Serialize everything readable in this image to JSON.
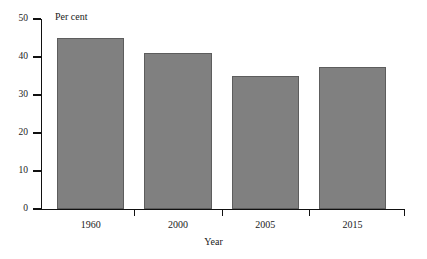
{
  "chart_data": {
    "type": "bar",
    "title": "",
    "categories": [
      "1960",
      "2000",
      "2005",
      "2015"
    ],
    "values": [
      45,
      41,
      35,
      37.5
    ],
    "series": [
      {
        "name": "Per cent",
        "values": [
          45,
          41,
          35,
          37.5
        ]
      }
    ],
    "xlabel": "Year",
    "ylabel": "Per cent",
    "ylim": [
      0,
      50
    ],
    "yticks": [
      0,
      10,
      20,
      30,
      40,
      50
    ],
    "ytick_labels": [
      "0",
      "10",
      "20",
      "30",
      "40",
      "50"
    ],
    "grid": false,
    "legend": false,
    "bar_color": "#808080",
    "bar_edge_color": "#5d5d5d",
    "axis_color": "#111111",
    "background": "#ffffff"
  },
  "axes": {
    "y_title": "Per cent",
    "x_title": "Year"
  }
}
